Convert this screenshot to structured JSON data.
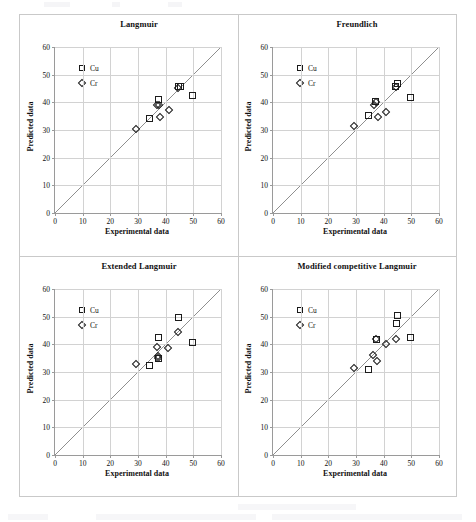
{
  "figure": {
    "layout": "2x2 grid of parity scatter plots",
    "panel_count": 4
  },
  "axes_common": {
    "xlabel": "Experimental data",
    "ylabel": "Predicted data",
    "xticks": [
      0,
      10,
      20,
      30,
      40,
      50,
      60
    ],
    "yticks": [
      0,
      10,
      20,
      30,
      40,
      50,
      60
    ],
    "xlim": [
      0,
      60
    ],
    "ylim": [
      0,
      60
    ],
    "grid": true,
    "legend_position": "upper-left inside axes",
    "legend": [
      {
        "label": "Cu",
        "marker": "square"
      },
      {
        "label": "Cr",
        "marker": "diamond"
      }
    ],
    "reference_line": "1:1 parity line"
  },
  "chart_data": [
    {
      "type": "scatter",
      "title": "Langmuir",
      "xlabel": "Experimental data",
      "ylabel": "Predicted data",
      "xlim": [
        0,
        60
      ],
      "ylim": [
        0,
        60
      ],
      "xticks": [
        0,
        10,
        20,
        30,
        40,
        50,
        60
      ],
      "yticks": [
        0,
        10,
        20,
        30,
        40,
        50,
        60
      ],
      "grid": true,
      "legend": [
        "Cu",
        "Cr"
      ],
      "reference_line": {
        "type": "1:1",
        "from": [
          0,
          0
        ],
        "to": [
          60,
          60
        ]
      },
      "series": [
        {
          "name": "Cu",
          "marker": "square",
          "points": [
            [
              34.3,
              34.3
            ],
            [
              37.4,
              41.2
            ],
            [
              44.6,
              45.6
            ],
            [
              45.3,
              45.6
            ],
            [
              49.8,
              42.6
            ]
          ]
        },
        {
          "name": "Cr",
          "marker": "diamond",
          "points": [
            [
              29.2,
              30.4
            ],
            [
              36.9,
              39.2
            ],
            [
              37.6,
              38.9
            ],
            [
              37.9,
              34.7
            ],
            [
              41.1,
              37.1
            ],
            [
              44.6,
              45.2
            ]
          ]
        }
      ]
    },
    {
      "type": "scatter",
      "title": "Freundlich",
      "xlabel": "Experimental data",
      "ylabel": "Predicted data",
      "xlim": [
        0,
        60
      ],
      "ylim": [
        0,
        60
      ],
      "xticks": [
        0,
        10,
        20,
        30,
        40,
        50,
        60
      ],
      "yticks": [
        0,
        10,
        20,
        30,
        40,
        50,
        60
      ],
      "grid": true,
      "legend": [
        "Cu",
        "Cr"
      ],
      "reference_line": {
        "type": "1:1",
        "from": [
          0,
          0
        ],
        "to": [
          60,
          60
        ]
      },
      "series": [
        {
          "name": "Cu",
          "marker": "square",
          "points": [
            [
              34.4,
              35.1
            ],
            [
              37.2,
              40.4
            ],
            [
              44.2,
              45.8
            ],
            [
              45.0,
              46.7
            ],
            [
              49.8,
              41.8
            ]
          ]
        },
        {
          "name": "Cr",
          "marker": "diamond",
          "points": [
            [
              29.3,
              31.5
            ],
            [
              36.6,
              39.0
            ],
            [
              37.2,
              40.0
            ],
            [
              37.9,
              34.7
            ],
            [
              40.9,
              36.6
            ],
            [
              44.4,
              45.6
            ]
          ]
        }
      ]
    },
    {
      "type": "scatter",
      "title": "Extended Langmuir",
      "xlabel": "Experimental data",
      "ylabel": "Predicted data",
      "xlim": [
        0,
        60
      ],
      "ylim": [
        0,
        60
      ],
      "xticks": [
        0,
        10,
        20,
        30,
        40,
        50,
        60
      ],
      "yticks": [
        0,
        10,
        20,
        30,
        40,
        50,
        60
      ],
      "grid": true,
      "legend": [
        "Cu",
        "Cr"
      ],
      "reference_line": {
        "type": "1:1",
        "from": [
          0,
          0
        ],
        "to": [
          60,
          60
        ]
      },
      "series": [
        {
          "name": "Cu",
          "marker": "square",
          "points": [
            [
              34.3,
              32.5
            ],
            [
              37.3,
              42.4
            ],
            [
              37.5,
              34.7
            ],
            [
              44.8,
              49.7
            ],
            [
              49.8,
              40.8
            ]
          ]
        },
        {
          "name": "Cr",
          "marker": "diamond",
          "points": [
            [
              29.4,
              33.0
            ],
            [
              36.7,
              39.2
            ],
            [
              37.2,
              35.9
            ],
            [
              37.3,
              34.9
            ],
            [
              41.0,
              38.7
            ],
            [
              44.4,
              44.6
            ]
          ]
        }
      ]
    },
    {
      "type": "scatter",
      "title": "Modified competitive Langmuir",
      "xlabel": "Experimental data",
      "ylabel": "Predicted data",
      "xlim": [
        0,
        60
      ],
      "ylim": [
        0,
        60
      ],
      "xticks": [
        0,
        10,
        20,
        30,
        40,
        50,
        60
      ],
      "yticks": [
        0,
        10,
        20,
        30,
        40,
        50,
        60
      ],
      "grid": true,
      "legend": [
        "Cu",
        "Cr"
      ],
      "reference_line": {
        "type": "1:1",
        "from": [
          0,
          0
        ],
        "to": [
          60,
          60
        ]
      },
      "series": [
        {
          "name": "Cu",
          "marker": "square",
          "points": [
            [
              34.5,
              31.0
            ],
            [
              37.3,
              41.7
            ],
            [
              44.6,
              47.4
            ],
            [
              45.0,
              50.5
            ],
            [
              49.8,
              42.4
            ]
          ]
        },
        {
          "name": "Cr",
          "marker": "diamond",
          "points": [
            [
              29.3,
              31.3
            ],
            [
              36.1,
              36.3
            ],
            [
              37.1,
              41.8
            ],
            [
              37.6,
              34.1
            ],
            [
              41.0,
              40.2
            ],
            [
              44.6,
              41.8
            ]
          ]
        }
      ]
    }
  ],
  "colors": {
    "marker_stroke": "#1c1c1c",
    "gridline": "#d2d2d2",
    "axis": "#9a9a9a",
    "reference_line": "#8f8f8f",
    "frame": "#c9c9c9",
    "text": "#111111",
    "background": "#ffffff"
  }
}
